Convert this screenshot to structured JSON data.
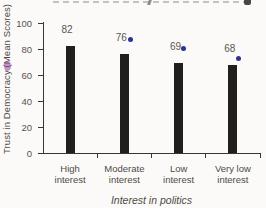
{
  "chart_data": {
    "type": "bar",
    "categories": [
      "High interest",
      "Moderate interest",
      "Low interest",
      "Very low interest"
    ],
    "values": [
      82,
      76,
      69,
      68
    ],
    "value_labels": [
      "82",
      "76",
      "69",
      "68"
    ],
    "title": "",
    "xlabel": "Interest in politics",
    "ylabel": "Trust in Democracy (Mean Scores)",
    "ylim": [
      0,
      100
    ],
    "yticks": [
      0,
      20,
      40,
      60,
      80,
      100
    ],
    "grid": false,
    "legend": false,
    "bar_color": "#211e1b",
    "value_label_color": "#5a5651",
    "dot_markers": {
      "color": "#2e3192",
      "per_bar": [
        false,
        true,
        true,
        true
      ],
      "offsets": [
        null,
        {
          "dx": 6,
          "dy": 0
        },
        {
          "dx": 5,
          "dy": 0
        },
        {
          "dx": 6,
          "dy": 8
        }
      ]
    }
  }
}
